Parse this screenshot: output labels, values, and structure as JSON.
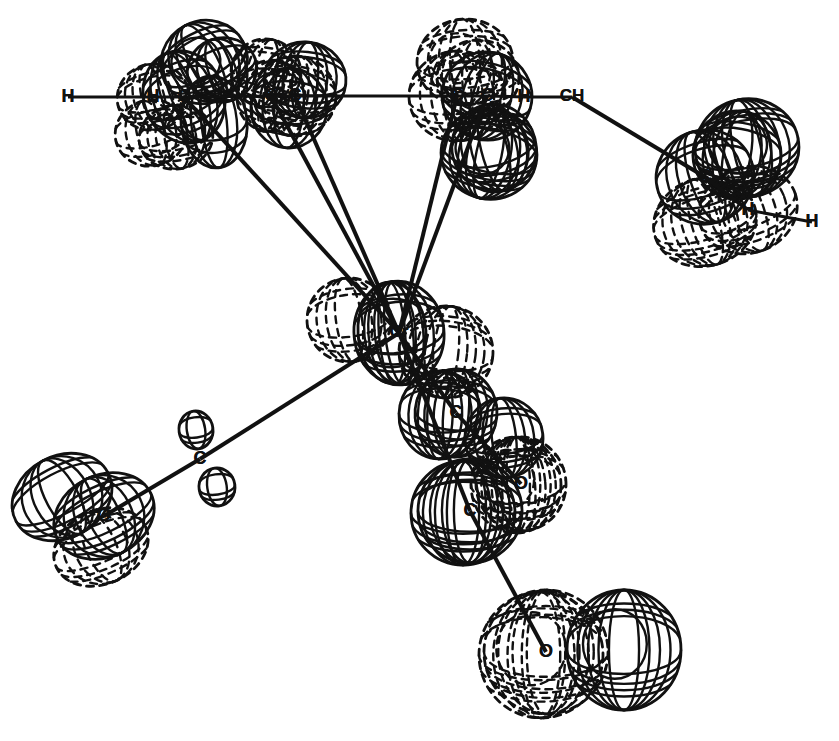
{
  "figure": {
    "kind": "ortep-thermal-ellipsoid-plot",
    "title": "",
    "background_color": "#ffffff",
    "line_color": "#111111",
    "dash_color": "#111111",
    "width": 839,
    "height": 741,
    "faint_caption": ""
  },
  "chart_data": {
    "type": "scatter",
    "title": "",
    "xlabel": "",
    "ylabel": "",
    "legend": [],
    "atoms": [
      {
        "id": "H1",
        "label": "H",
        "x": 68,
        "y": 97,
        "rx": 0,
        "ry": 0,
        "style": "none",
        "tilt": 0
      },
      {
        "id": "H2",
        "label": "H",
        "x": 153,
        "y": 97,
        "rx": 36,
        "ry": 33,
        "style": "dashed",
        "tilt": -14
      },
      {
        "id": "C1",
        "label": "C",
        "x": 184,
        "y": 97,
        "rx": 40,
        "ry": 47,
        "style": "solid",
        "tilt": -22
      },
      {
        "id": "C2",
        "label": "C",
        "x": 271,
        "y": 96,
        "rx": 34,
        "ry": 36,
        "style": "dashed",
        "tilt": 12
      },
      {
        "id": "C3",
        "label": "C",
        "x": 295,
        "y": 96,
        "rx": 41,
        "ry": 40,
        "style": "dashed",
        "tilt": 8
      },
      {
        "id": "C4",
        "label": "C",
        "x": 457,
        "y": 96,
        "rx": 48,
        "ry": 45,
        "style": "dashed",
        "tilt": -6
      },
      {
        "id": "C5",
        "label": "C",
        "x": 487,
        "y": 96,
        "rx": 45,
        "ry": 44,
        "style": "solid",
        "tilt": 16
      },
      {
        "id": "H3",
        "label": "H",
        "x": 524,
        "y": 97,
        "rx": 0,
        "ry": 0,
        "style": "none",
        "tilt": 0
      },
      {
        "id": "CH1",
        "label": "CH",
        "x": 572,
        "y": 97,
        "rx": 0,
        "ry": 0,
        "style": "none",
        "tilt": 0
      },
      {
        "id": "C6",
        "label": "C",
        "x": 705,
        "y": 177,
        "rx": 49,
        "ry": 47,
        "style": "solid",
        "tilt": -18
      },
      {
        "id": "H4",
        "label": "H",
        "x": 748,
        "y": 210,
        "rx": 50,
        "ry": 43,
        "style": "dashed",
        "tilt": -20
      },
      {
        "id": "H5",
        "label": "H",
        "x": 812,
        "y": 222,
        "rx": 0,
        "ry": 0,
        "style": "none",
        "tilt": 0
      },
      {
        "id": "Cr",
        "label": "Cr",
        "x": 399,
        "y": 333,
        "rx": 45,
        "ry": 52,
        "style": "solid",
        "tilt": -6
      },
      {
        "id": "C7",
        "label": "C",
        "x": 200,
        "y": 459,
        "rx": 0,
        "ry": 0,
        "style": "none",
        "tilt": 0
      },
      {
        "id": "O1",
        "label": "O",
        "x": 104,
        "y": 516,
        "rx": 52,
        "ry": 41,
        "style": "solid",
        "tilt": -26
      },
      {
        "id": "C8",
        "label": "C",
        "x": 456,
        "y": 413,
        "rx": 41,
        "ry": 44,
        "style": "solid",
        "tilt": 5
      },
      {
        "id": "O2",
        "label": "O",
        "x": 521,
        "y": 484,
        "rx": 45,
        "ry": 47,
        "style": "dashed",
        "tilt": -5
      },
      {
        "id": "C9",
        "label": "C",
        "x": 470,
        "y": 511,
        "rx": 52,
        "ry": 52,
        "style": "solid",
        "tilt": 0
      },
      {
        "id": "O3",
        "label": "O",
        "x": 546,
        "y": 652,
        "rx": 62,
        "ry": 62,
        "style": "dashed",
        "tilt": 0
      }
    ],
    "bonds": [
      {
        "from": "H1",
        "to": "H2",
        "weight": 3
      },
      {
        "from": "H2",
        "to": "C1",
        "weight": 3
      },
      {
        "from": "C1",
        "to": "C2",
        "weight": 3
      },
      {
        "from": "C2",
        "to": "C3",
        "weight": 3
      },
      {
        "from": "C3",
        "to": "C4",
        "weight": 3
      },
      {
        "from": "C4",
        "to": "C5",
        "weight": 3
      },
      {
        "from": "C5",
        "to": "H3",
        "weight": 3
      },
      {
        "from": "H3",
        "to": "CH1",
        "weight": 3
      },
      {
        "from": "CH1",
        "to": "C6",
        "weight": 4
      },
      {
        "from": "C6",
        "to": "H4",
        "weight": 4
      },
      {
        "from": "H4",
        "to": "H5",
        "weight": 3
      },
      {
        "from": "C1",
        "to": "Cr",
        "weight": 4
      },
      {
        "from": "C2",
        "to": "Cr",
        "weight": 4
      },
      {
        "from": "C3",
        "to": "Cr",
        "weight": 4
      },
      {
        "from": "C4",
        "to": "Cr",
        "weight": 4
      },
      {
        "from": "C5",
        "to": "Cr",
        "weight": 4
      },
      {
        "from": "Cr",
        "to": "C7",
        "weight": 4
      },
      {
        "from": "C7",
        "to": "O1",
        "weight": 4
      },
      {
        "from": "Cr",
        "to": "C8",
        "weight": 4
      },
      {
        "from": "C8",
        "to": "O2",
        "weight": 4
      },
      {
        "from": "Cr",
        "to": "C9",
        "weight": 4
      },
      {
        "from": "C9",
        "to": "O3",
        "weight": 4
      }
    ],
    "ellipsoids": [
      {
        "id": "e01",
        "cx": 204,
        "cy": 62,
        "rx": 44,
        "ry": 41,
        "tilt": -28,
        "style": "solid",
        "rings": 3,
        "inner": true
      },
      {
        "id": "e02",
        "cx": 222,
        "cy": 70,
        "rx": 35,
        "ry": 32,
        "tilt": -20,
        "style": "solid",
        "rings": 2,
        "inner": false
      },
      {
        "id": "e03",
        "cx": 176,
        "cy": 137,
        "rx": 37,
        "ry": 32,
        "tilt": -10,
        "style": "dashed",
        "rings": 3,
        "inner": false
      },
      {
        "id": "e04",
        "cx": 214,
        "cy": 122,
        "rx": 33,
        "ry": 46,
        "tilt": -6,
        "style": "solid",
        "rings": 2,
        "inner": false
      },
      {
        "id": "e05",
        "cx": 266,
        "cy": 73,
        "rx": 35,
        "ry": 34,
        "tilt": 10,
        "style": "dashed",
        "rings": 3,
        "inner": false
      },
      {
        "id": "e06",
        "cx": 305,
        "cy": 80,
        "rx": 41,
        "ry": 38,
        "tilt": 6,
        "style": "solid",
        "rings": 3,
        "inner": false
      },
      {
        "id": "e07",
        "cx": 289,
        "cy": 108,
        "rx": 38,
        "ry": 40,
        "tilt": 4,
        "style": "solid",
        "rings": 2,
        "inner": false
      },
      {
        "id": "e08",
        "cx": 465,
        "cy": 62,
        "rx": 48,
        "ry": 43,
        "tilt": -4,
        "style": "dashed",
        "rings": 3,
        "inner": true
      },
      {
        "id": "e09",
        "cx": 478,
        "cy": 78,
        "rx": 41,
        "ry": 38,
        "tilt": -2,
        "style": "dashed",
        "rings": 2,
        "inner": false
      },
      {
        "id": "e10",
        "cx": 489,
        "cy": 154,
        "rx": 48,
        "ry": 45,
        "tilt": 12,
        "style": "solid",
        "rings": 4,
        "inner": true
      },
      {
        "id": "e11",
        "cx": 494,
        "cy": 148,
        "rx": 42,
        "ry": 44,
        "tilt": -14,
        "style": "solid",
        "rings": 3,
        "inner": false
      },
      {
        "id": "e12",
        "cx": 747,
        "cy": 148,
        "rx": 52,
        "ry": 49,
        "tilt": -12,
        "style": "solid",
        "rings": 4,
        "inner": true
      },
      {
        "id": "e13",
        "cx": 737,
        "cy": 155,
        "rx": 44,
        "ry": 44,
        "tilt": 10,
        "style": "solid",
        "rings": 3,
        "inner": false
      },
      {
        "id": "e14",
        "cx": 705,
        "cy": 222,
        "rx": 52,
        "ry": 44,
        "tilt": -16,
        "style": "dashed",
        "rings": 4,
        "inner": false
      },
      {
        "id": "e15",
        "cx": 349,
        "cy": 320,
        "rx": 42,
        "ry": 42,
        "tilt": -8,
        "style": "dashed",
        "rings": 3,
        "inner": false
      },
      {
        "id": "e16",
        "cx": 392,
        "cy": 333,
        "rx": 34,
        "ry": 51,
        "tilt": -4,
        "style": "solid",
        "rings": 2,
        "inner": false
      },
      {
        "id": "e17",
        "cx": 446,
        "cy": 352,
        "rx": 47,
        "ry": 46,
        "tilt": 6,
        "style": "dashed",
        "rings": 4,
        "inner": false
      },
      {
        "id": "e18",
        "cx": 440,
        "cy": 415,
        "rx": 41,
        "ry": 44,
        "tilt": 2,
        "style": "solid",
        "rings": 3,
        "inner": false
      },
      {
        "id": "e19",
        "cx": 504,
        "cy": 438,
        "rx": 39,
        "ry": 40,
        "tilt": -6,
        "style": "solid",
        "rings": 3,
        "inner": false
      },
      {
        "id": "e20",
        "cx": 516,
        "cy": 485,
        "rx": 45,
        "ry": 48,
        "tilt": 0,
        "style": "dashed",
        "rings": 3,
        "inner": true
      },
      {
        "id": "e21",
        "cx": 463,
        "cy": 513,
        "rx": 52,
        "ry": 52,
        "tilt": 0,
        "style": "solid",
        "rings": 3,
        "inner": false
      },
      {
        "id": "e22",
        "cx": 541,
        "cy": 655,
        "rx": 62,
        "ry": 63,
        "tilt": 0,
        "style": "dashed",
        "rings": 3,
        "inner": true
      },
      {
        "id": "e23",
        "cx": 624,
        "cy": 650,
        "rx": 57,
        "ry": 60,
        "tilt": 0,
        "style": "solid",
        "rings": 4,
        "inner": true
      },
      {
        "id": "e24",
        "cx": 196,
        "cy": 430,
        "rx": 17,
        "ry": 19,
        "tilt": -8,
        "style": "solid",
        "rings": 1,
        "inner": false
      },
      {
        "id": "e25",
        "cx": 217,
        "cy": 487,
        "rx": 18,
        "ry": 19,
        "tilt": -8,
        "style": "solid",
        "rings": 1,
        "inner": false
      },
      {
        "id": "e26",
        "cx": 62,
        "cy": 497,
        "rx": 52,
        "ry": 41,
        "tilt": -28,
        "style": "solid",
        "rings": 3,
        "inner": false
      },
      {
        "id": "e27",
        "cx": 101,
        "cy": 547,
        "rx": 49,
        "ry": 37,
        "tilt": -24,
        "style": "dashed",
        "rings": 3,
        "inner": false
      },
      {
        "id": "e28",
        "cx": 151,
        "cy": 133,
        "rx": 36,
        "ry": 33,
        "tilt": -14,
        "style": "dashed",
        "rings": 2,
        "inner": false
      }
    ]
  },
  "labels": {
    "hydrogen": "H",
    "carbon": "C",
    "oxygen": "O",
    "chromium": "Cr",
    "methine": "CH"
  }
}
